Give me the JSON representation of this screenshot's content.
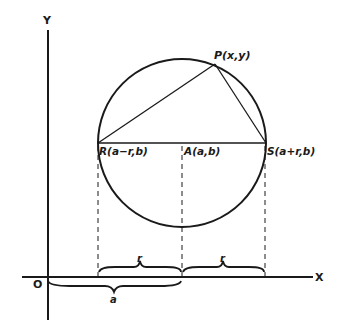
{
  "diagram": {
    "axes": {
      "x_label": "X",
      "y_label": "Y",
      "origin_label": "O"
    },
    "circle": {
      "center": {
        "cx": 182,
        "cy": 143
      },
      "radius": 84
    },
    "points": {
      "P": {
        "label": "P(x,y)",
        "x": 215,
        "y": 64
      },
      "R": {
        "label": "R(a−r,b)",
        "x": 98,
        "y": 143
      },
      "A": {
        "label": "A(a,b)",
        "x": 182,
        "y": 143
      },
      "S": {
        "label": "S(a+r,b)",
        "x": 266,
        "y": 143
      }
    },
    "braces": {
      "r_left": "r",
      "r_right": "r",
      "a": "a"
    },
    "colors": {
      "ink": "#1a1a1a",
      "background": "#ffffff"
    }
  }
}
